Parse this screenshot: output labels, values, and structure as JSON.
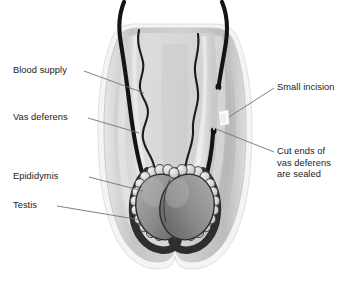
{
  "figure": {
    "background_color": "#ffffff"
  },
  "labels": {
    "blood_supply": "Blood supply",
    "vas_deferens": "Vas deferens",
    "epididymis": "Epididymis",
    "testis": "Testis",
    "small_incision": "Small incision",
    "cut_ends_line1": "Cut ends of",
    "cut_ends_line2": "vas deferens",
    "cut_ends_line3": "are sealed"
  },
  "colors": {
    "text": "#1b1b1b",
    "leader_line": "#6d6d6d",
    "scrotum_outer_rim": "#f2f2f2",
    "scrotum_wall": "#c9c9c9",
    "scrotum_cavity": "#d6d6d6",
    "scrotum_inner_shadow": "#b4b4b4",
    "cord_sheath": "#cfcfcf",
    "cord_sheath_light": "#e8e8e8",
    "vas_deferens": "#151515",
    "blood_vessel": "#1d1d1d",
    "testis_fill_light": "#9b9b9b",
    "testis_fill_dark": "#6a6a6a",
    "testis_outline": "#2a2a2a",
    "epididymis_lobule": "#d9d9d9",
    "epididymis_outline": "#3a3a3a",
    "incision_highlight": "#ffffff"
  },
  "anatomy": {
    "structures": [
      "scrotum",
      "left spermatic cord",
      "right spermatic cord",
      "left vas deferens",
      "right vas deferens (cut)",
      "left testis",
      "right testis",
      "left epididymis",
      "right epididymis",
      "blood supply vessels",
      "small incision"
    ]
  }
}
